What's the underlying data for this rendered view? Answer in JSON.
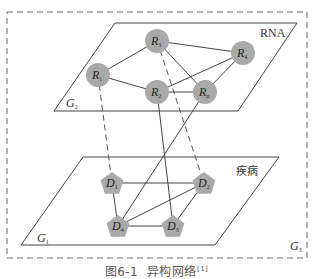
{
  "figure": {
    "caption_prefix": "图6-1",
    "caption_text": "异构网络",
    "caption_ref": "[1]"
  },
  "layers": {
    "top": {
      "name": "G2",
      "base": "G",
      "sub": "2",
      "label": "RNA"
    },
    "bottom": {
      "name": "G1",
      "base": "G",
      "sub": "1",
      "label": "疾病"
    },
    "outer": {
      "name": "G3",
      "base": "G",
      "sub": "3"
    }
  },
  "nodes": {
    "rna": [
      {
        "id": "R3",
        "base": "R",
        "sub": "3",
        "x": 157,
        "y": 41
      },
      {
        "id": "R4",
        "base": "R",
        "sub": "4",
        "x": 243,
        "y": 53
      },
      {
        "id": "R1",
        "base": "R",
        "sub": "1",
        "x": 98,
        "y": 75
      },
      {
        "id": "R2",
        "base": "R",
        "sub": "2",
        "x": 157,
        "y": 92
      },
      {
        "id": "Rn",
        "base": "R",
        "sub": "n",
        "x": 205,
        "y": 92
      }
    ],
    "disease": [
      {
        "id": "D1",
        "base": "D",
        "sub": "1",
        "x": 112,
        "y": 183
      },
      {
        "id": "D2",
        "base": "D",
        "sub": "2",
        "x": 204,
        "y": 183
      },
      {
        "id": "D4",
        "base": "D",
        "sub": "4",
        "x": 118,
        "y": 226
      },
      {
        "id": "D3",
        "base": "D",
        "sub": "3",
        "x": 173,
        "y": 226
      }
    ]
  },
  "edges": {
    "rna_rna": [
      [
        "R1",
        "R3"
      ],
      [
        "R1",
        "R2"
      ],
      [
        "R3",
        "R4"
      ],
      [
        "R3",
        "Rn"
      ],
      [
        "R2",
        "R4"
      ],
      [
        "R2",
        "Rn"
      ],
      [
        "Rn",
        "R4"
      ]
    ],
    "disease_disease": [
      [
        "D1",
        "D2"
      ],
      [
        "D1",
        "D4"
      ],
      [
        "D4",
        "D2"
      ],
      [
        "D4",
        "D3"
      ],
      [
        "D3",
        "D2"
      ]
    ],
    "rna_disease_solid": [
      [
        "R2",
        "D3"
      ],
      [
        "Rn",
        "D4"
      ]
    ],
    "rna_disease_dashed": [
      [
        "R1",
        "D1"
      ],
      [
        "R3",
        "D2"
      ]
    ]
  },
  "colors": {
    "line": "#444444",
    "node_fill": "#a9a9a9",
    "dash": "#555555"
  }
}
